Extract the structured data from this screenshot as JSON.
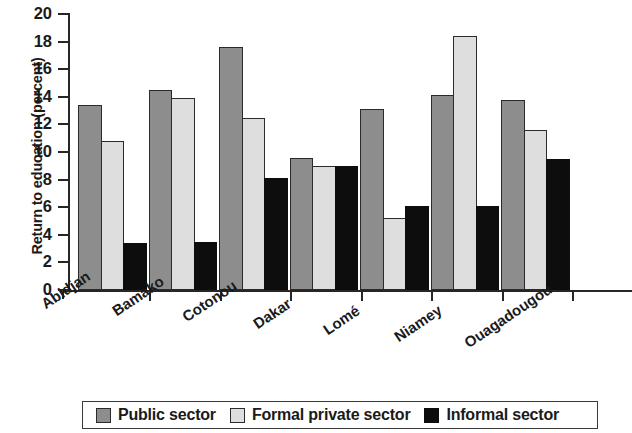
{
  "chart_data": {
    "type": "bar",
    "title": "",
    "xlabel": "",
    "ylabel": "Return to education (percent)",
    "ylim": [
      0,
      20
    ],
    "ytick_values": [
      0,
      2,
      4,
      6,
      8,
      10,
      12,
      14,
      16,
      18,
      20
    ],
    "ytick_labels": [
      "0",
      "2",
      "4",
      "6",
      "8",
      "10",
      "12",
      "14",
      "16",
      "18",
      "20"
    ],
    "grid": false,
    "legend_position": "bottom",
    "categories": [
      "Abidjan",
      "Bamako",
      "Cotonou",
      "Dakar",
      "Lomé",
      "Niamey",
      "Ouagadougou"
    ],
    "series": [
      {
        "name": "Public sector",
        "color": "#8d8d8d",
        "values": [
          13.4,
          14.5,
          17.6,
          9.6,
          13.1,
          14.1,
          13.8
        ]
      },
      {
        "name": "Formal private sector",
        "color": "#dedede",
        "values": [
          10.8,
          13.9,
          12.5,
          9.0,
          5.2,
          18.4,
          11.6
        ]
      },
      {
        "name": "Informal sector",
        "color": "#0d0d0d",
        "values": [
          3.4,
          3.5,
          8.1,
          9.0,
          6.1,
          6.1,
          9.5
        ]
      }
    ]
  },
  "axis": {
    "tick_color": "#262626"
  }
}
